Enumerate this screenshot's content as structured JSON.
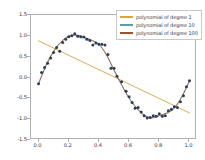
{
  "chart_data": {
    "type": "scatter",
    "title": "",
    "xlabel": "",
    "ylabel": "",
    "xlim": [
      -0.05,
      1.05
    ],
    "ylim": [
      -1.5,
      1.5
    ],
    "grid": false,
    "legend_position": "upper right",
    "xticks": [
      "0.0",
      "0.2",
      "0.4",
      "0.6",
      "0.8",
      "1.0"
    ],
    "xtick_values": [
      0.0,
      0.2,
      0.4,
      0.6,
      0.8,
      1.0
    ],
    "yticks": [
      "1.5",
      "1.0",
      "0.5",
      "0.0",
      "-0.5",
      "-1.0",
      "-1.5"
    ],
    "ytick_values": [
      1.5,
      1.0,
      0.5,
      0.0,
      -0.5,
      -1.0,
      -1.5
    ],
    "scatter": {
      "name": "samples",
      "color": "#2f3b5c",
      "marker": "o",
      "x": [
        0.0,
        0.02,
        0.04,
        0.06,
        0.08,
        0.1,
        0.12,
        0.14,
        0.16,
        0.18,
        0.2,
        0.22,
        0.24,
        0.26,
        0.28,
        0.3,
        0.32,
        0.34,
        0.36,
        0.38,
        0.4,
        0.42,
        0.44,
        0.46,
        0.48,
        0.5,
        0.52,
        0.55,
        0.58,
        0.6,
        0.62,
        0.64,
        0.66,
        0.68,
        0.7,
        0.72,
        0.74,
        0.76,
        0.78,
        0.8,
        0.82,
        0.84,
        0.86,
        0.88,
        0.9,
        0.92,
        0.94,
        0.96,
        0.98,
        1.0
      ],
      "y": [
        -0.15,
        0.12,
        0.24,
        0.34,
        0.47,
        0.6,
        0.72,
        0.63,
        0.84,
        0.92,
        0.98,
        1.0,
        1.05,
        0.99,
        0.98,
        0.97,
        0.92,
        0.89,
        0.78,
        0.83,
        0.8,
        0.8,
        0.78,
        0.55,
        0.22,
        0.22,
        0.03,
        -0.1,
        -0.33,
        -0.46,
        -0.6,
        -0.74,
        -0.72,
        -0.83,
        -0.92,
        -0.97,
        -0.96,
        -0.92,
        -0.93,
        -0.87,
        -0.93,
        -0.92,
        -0.8,
        -0.76,
        -0.7,
        -0.72,
        -0.58,
        -0.44,
        -0.22,
        -0.08
      ]
    },
    "series": [
      {
        "name": "polynomial of degree 1",
        "degree": 1,
        "type": "line",
        "color": "#d9a441",
        "x": [
          0.0,
          1.0
        ],
        "y": [
          0.88,
          -0.85
        ]
      },
      {
        "name": "polynomial of degree 10",
        "degree": 10,
        "type": "line",
        "color": "#5f9ea0",
        "x": [
          0.0,
          0.05,
          0.1,
          0.15,
          0.2,
          0.25,
          0.3,
          0.35,
          0.4,
          0.45,
          0.5,
          0.55,
          0.6,
          0.65,
          0.7,
          0.75,
          0.8,
          0.85,
          0.9,
          0.95,
          1.0
        ],
        "y": [
          -0.14,
          0.27,
          0.62,
          0.85,
          0.98,
          1.01,
          0.97,
          0.9,
          0.79,
          0.55,
          0.17,
          -0.18,
          -0.5,
          -0.74,
          -0.9,
          -0.96,
          -0.92,
          -0.86,
          -0.74,
          -0.47,
          -0.09
        ]
      },
      {
        "name": "polynomial of degree 100",
        "degree": 100,
        "type": "line",
        "color": "#a0522d",
        "x": [
          0.0,
          0.05,
          0.1,
          0.15,
          0.2,
          0.25,
          0.3,
          0.35,
          0.4,
          0.45,
          0.5,
          0.55,
          0.6,
          0.65,
          0.7,
          0.75,
          0.8,
          0.85,
          0.9,
          0.95,
          1.0
        ],
        "y": [
          -0.15,
          0.3,
          0.63,
          0.86,
          0.99,
          1.02,
          0.96,
          0.89,
          0.8,
          0.54,
          0.18,
          -0.17,
          -0.49,
          -0.73,
          -0.91,
          -0.97,
          -0.91,
          -0.85,
          -0.73,
          -0.45,
          -0.08
        ]
      }
    ]
  },
  "legend": {
    "items": [
      {
        "label": "polynomial of degree 1",
        "color": "#d9a441"
      },
      {
        "label": "polynomial of degree 10",
        "color": "#5f9ea0"
      },
      {
        "label": "polynomial of degree 100",
        "color": "#a0522d"
      }
    ]
  }
}
